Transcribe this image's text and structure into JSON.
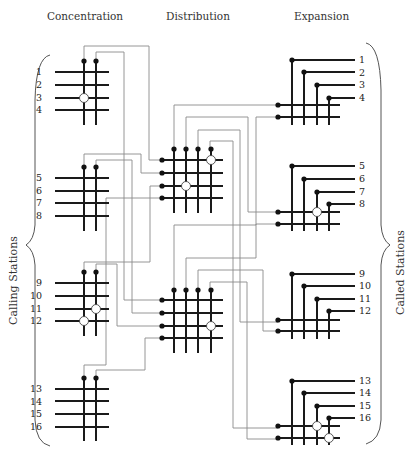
{
  "headings": {
    "concentration": "Concentration",
    "distribution": "Distribution",
    "expansion": "Expansion"
  },
  "side_labels": {
    "calling": "Calling Stations",
    "called": "Called Stations"
  },
  "calling_stations": [
    "1",
    "2",
    "3",
    "4",
    "5",
    "6",
    "7",
    "8",
    "9",
    "10",
    "11",
    "12",
    "13",
    "14",
    "15",
    "16"
  ],
  "called_stations": [
    "1",
    "2",
    "3",
    "4",
    "5",
    "6",
    "7",
    "8",
    "9",
    "10",
    "11",
    "12",
    "13",
    "14",
    "15",
    "16"
  ],
  "stages": {
    "concentration": {
      "blocks": 4,
      "inputs_per_block": 4,
      "outputs_per_block": 2
    },
    "distribution": {
      "blocks": 2,
      "inputs_per_block": 4,
      "outputs_per_block": 4
    },
    "expansion": {
      "blocks": 4,
      "inputs_per_block": 2,
      "outputs_per_block": 4
    }
  },
  "active_crosspoints": {
    "concentration": [
      "block1: row3-col1",
      "block3: row3-col2",
      "block3: row4-col1"
    ],
    "distribution": [
      "block1: row1-col4",
      "block1: row3-col1",
      "block2: row3-col4"
    ],
    "expansion": [
      "block2: row1-col3",
      "block4: row1-col3",
      "block4: row2-col4"
    ]
  }
}
